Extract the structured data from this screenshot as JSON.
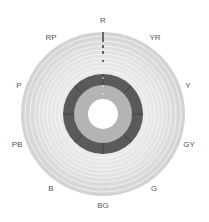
{
  "diagram": {
    "type": "munsell-hue-wheel",
    "center": [
      103,
      114
    ],
    "hue_labels": [
      {
        "label": "R",
        "x": 103,
        "y": 21
      },
      {
        "label": "YR",
        "x": 155,
        "y": 38
      },
      {
        "label": "Y",
        "x": 188,
        "y": 86
      },
      {
        "label": "GY",
        "x": 189,
        "y": 145
      },
      {
        "label": "G",
        "x": 154,
        "y": 189
      },
      {
        "label": "BG",
        "x": 103,
        "y": 206
      },
      {
        "label": "B",
        "x": 51,
        "y": 189
      },
      {
        "label": "PB",
        "x": 17,
        "y": 145
      },
      {
        "label": "P",
        "x": 19,
        "y": 86
      },
      {
        "label": "RP",
        "x": 51,
        "y": 38
      }
    ],
    "colors": {
      "outer_ring": "#d8d8d8",
      "ring_lines": "#f2f2f2",
      "dark_ring": "#5a5a5a",
      "inner_ring": "#b4b4b4",
      "center": "#ffffff",
      "label": "#555555"
    }
  }
}
